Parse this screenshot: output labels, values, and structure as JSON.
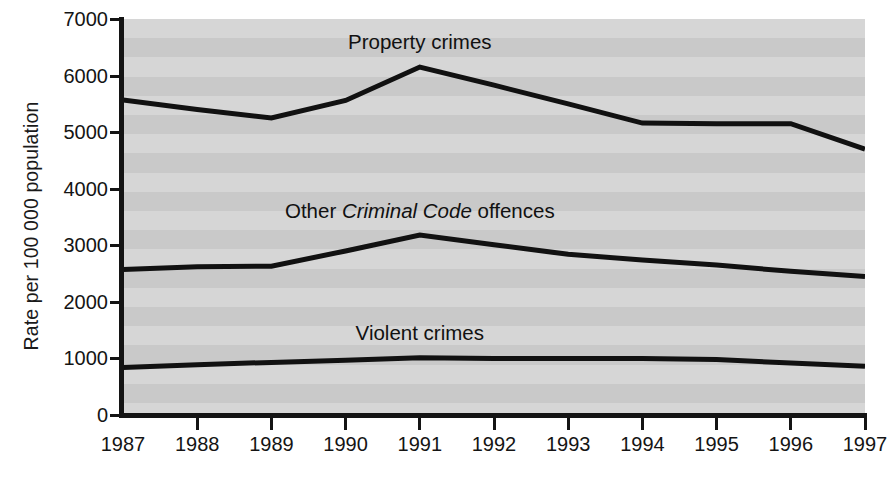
{
  "chart_data": {
    "type": "line",
    "title": "",
    "xlabel": "",
    "ylabel": "Rate per 100 000 population",
    "x": [
      1987,
      1988,
      1989,
      1990,
      1991,
      1992,
      1993,
      1994,
      1995,
      1996,
      1997
    ],
    "categories": [
      "1987",
      "1988",
      "1989",
      "1990",
      "1991",
      "1992",
      "1993",
      "1994",
      "1995",
      "1996",
      "1997"
    ],
    "ylim": [
      0,
      7000
    ],
    "yticks": [
      0,
      1000,
      2000,
      3000,
      4000,
      5000,
      6000,
      7000
    ],
    "ytick_labels": [
      "0",
      "1000",
      "2000",
      "3000",
      "4000",
      "5000",
      "6000",
      "7000"
    ],
    "grid": false,
    "background_bands": true,
    "legend": "inline-annotations",
    "series": [
      {
        "name": "Property crimes",
        "label": "Property crimes",
        "label_plain": "Property crimes",
        "color": "#111111",
        "values": [
          5570,
          5400,
          5250,
          5560,
          6150,
          5830,
          5500,
          5160,
          5150,
          5150,
          4700
        ]
      },
      {
        "name": "Other Criminal Code offences",
        "label_prefix": "Other ",
        "label_italic": "Criminal Code",
        "label_suffix": " offences",
        "label_plain": "Other Criminal Code offences",
        "color": "#111111",
        "values": [
          2570,
          2620,
          2630,
          2900,
          3180,
          3010,
          2840,
          2740,
          2650,
          2540,
          2450
        ]
      },
      {
        "name": "Violent crimes",
        "label": "Violent crimes",
        "label_plain": "Violent crimes",
        "color": "#111111",
        "values": [
          840,
          890,
          930,
          970,
          1010,
          1000,
          1000,
          1000,
          980,
          920,
          860
        ]
      }
    ],
    "annotations": [
      {
        "text": "Property crimes",
        "x_year": 1991,
        "y_value": 6600
      },
      {
        "text": "Other Criminal Code offences",
        "x_year": 1991,
        "y_value": 3600
      },
      {
        "text": "Violent crimes",
        "x_year": 1991,
        "y_value": 1450
      }
    ]
  }
}
